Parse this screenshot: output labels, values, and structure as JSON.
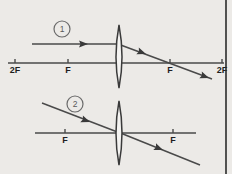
{
  "figure": {
    "background_color": "#eceae7",
    "ink_color": "#3a3a3a",
    "width": 232,
    "height": 174
  },
  "diagrams": [
    {
      "id": "diagram-1",
      "badge_label": "1",
      "badge": {
        "cx": 62,
        "cy": 29,
        "r": 8
      },
      "axis": {
        "x1": 8,
        "x2": 224,
        "y": 63
      },
      "lens": {
        "cx": 119,
        "cy": 57,
        "top": 25,
        "bottom": 88,
        "half_width": 5
      },
      "axis_ticks": [
        {
          "label": "2F",
          "x": 15
        },
        {
          "label": "F",
          "x": 68
        },
        {
          "label": "F",
          "x": 170
        },
        {
          "label": "2F",
          "x": 222
        }
      ],
      "incident_ray": {
        "name": "parallel-incident-ray",
        "x1": 32,
        "y1": 44,
        "x2": 119,
        "y2": 44,
        "arrow_at": {
          "x": 88,
          "y": 44
        }
      },
      "refracted_ray": {
        "name": "refracted-ray-through-focus",
        "x1": 119,
        "y1": 44,
        "x2": 212,
        "y2": 79,
        "arrows_at": [
          {
            "x": 146,
            "y": 54
          },
          {
            "x": 207,
            "y": 77
          }
        ]
      }
    },
    {
      "id": "diagram-2",
      "badge_label": "2",
      "badge": {
        "cx": 75,
        "cy": 104,
        "r": 8
      },
      "axis": {
        "x1": 35,
        "x2": 196,
        "y": 133
      },
      "lens": {
        "cx": 119,
        "cy": 133,
        "top": 101,
        "bottom": 165,
        "half_width": 5
      },
      "axis_ticks": [
        {
          "label": "F",
          "x": 65
        },
        {
          "label": "F",
          "x": 173
        }
      ],
      "incident_ray": {
        "name": "ray-through-lens-center-incident",
        "x1": 42,
        "y1": 103,
        "x2": 119,
        "y2": 133,
        "arrow_at": {
          "x": 90,
          "y": 122
        }
      },
      "refracted_ray": {
        "name": "ray-through-lens-center-emergent",
        "x1": 119,
        "y1": 133,
        "x2": 200,
        "y2": 165,
        "arrows_at": [
          {
            "x": 162,
            "y": 150
          }
        ]
      }
    }
  ],
  "frame": {
    "right_border_x": 226
  }
}
